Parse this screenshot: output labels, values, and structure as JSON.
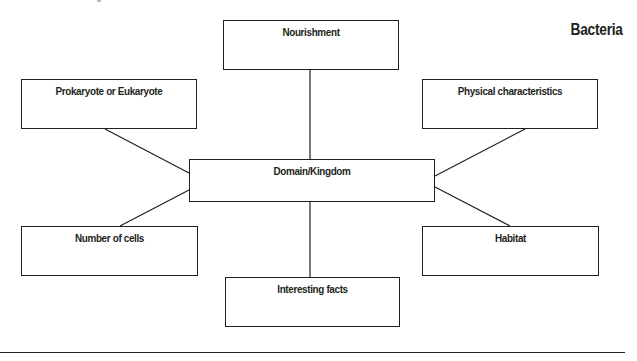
{
  "title": "Bacteria",
  "center": {
    "label": "Domain/Kingdom"
  },
  "nodes": {
    "top": {
      "label": "Nourishment"
    },
    "upper_left": {
      "label": "Prokaryote or Eukaryote"
    },
    "upper_right": {
      "label": "Physical characteristics"
    },
    "lower_left": {
      "label": "Number of cells"
    },
    "lower_right": {
      "label": "Habitat"
    },
    "bottom": {
      "label": "Interesting facts"
    }
  },
  "colors": {
    "stroke": "#231f20",
    "background": "#ffffff"
  }
}
